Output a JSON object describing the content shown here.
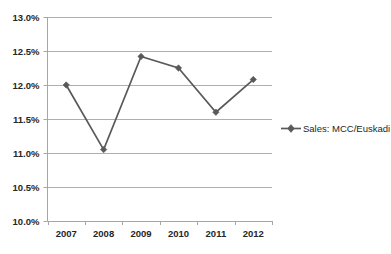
{
  "chart_data": {
    "type": "line",
    "title": "",
    "xlabel": "",
    "ylabel": "",
    "categories": [
      "2007",
      "2008",
      "2009",
      "2010",
      "2011",
      "2012"
    ],
    "series": [
      {
        "name": "Sales: MCC/Euskadi",
        "values": [
          12.0,
          11.05,
          12.42,
          12.25,
          11.6,
          12.08
        ],
        "color": "#595959",
        "marker": "diamond"
      }
    ],
    "ylim": [
      10.0,
      13.0
    ],
    "y_tick_step": 0.5,
    "y_tick_labels": [
      "13.0%",
      "12.5%",
      "12.0%",
      "11.5%",
      "11.0%",
      "10.5%",
      "10.0%"
    ],
    "y_tick_values": [
      13.0,
      12.5,
      12.0,
      11.5,
      11.0,
      10.5,
      10.0
    ],
    "x_tick_labels": [
      "2007",
      "2008",
      "2009",
      "2010",
      "2011",
      "2012"
    ],
    "grid": "horizontal",
    "legend_position": "right",
    "legend_entries": [
      "Sales: MCC/Euskadi"
    ],
    "value_suffix": "%"
  },
  "legend": {
    "series_label": "Sales: MCC/Euskadi"
  },
  "axes": {
    "y_labels": [
      "13.0%",
      "12.5%",
      "12.0%",
      "11.5%",
      "11.0%",
      "10.5%",
      "10.0%"
    ],
    "x_labels": [
      "2007",
      "2008",
      "2009",
      "2010",
      "2011",
      "2012"
    ]
  }
}
